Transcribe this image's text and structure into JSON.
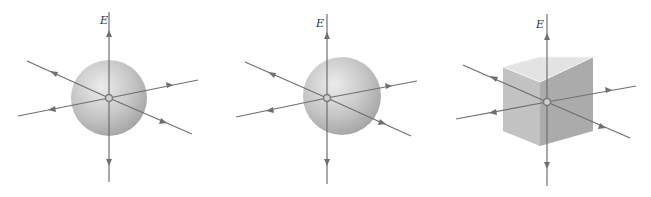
{
  "figure": {
    "panels": [
      {
        "id": "sphere-centered",
        "shape": "sphere",
        "field_label": "E",
        "charge": "point charge at center"
      },
      {
        "id": "sphere-offcenter",
        "shape": "sphere",
        "field_label": "E",
        "charge": "point charge off center"
      },
      {
        "id": "cube",
        "shape": "cube",
        "field_label": "E",
        "charge": "point charge inside cube"
      }
    ],
    "colors": {
      "field_line": "#6f6f6f",
      "surface_light": "#e2e2e2",
      "surface_dark": "#9c9c9c",
      "charge_ring": "#7a7a7a"
    }
  }
}
